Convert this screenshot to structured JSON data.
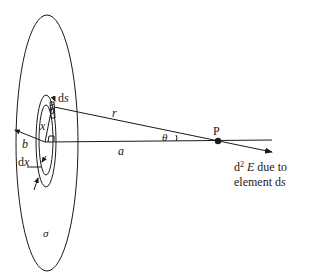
{
  "diagram": {
    "type": "physics-geometry",
    "labels": {
      "ds": "ds",
      "r": "r",
      "x": "x",
      "b": "b",
      "a": "a",
      "theta": "θ",
      "dx": "dx",
      "sigma": "σ",
      "P": "P",
      "field_line1": "d² E due to",
      "field_line1_d": "d",
      "field_line1_sup": "2",
      "field_line1_E": "E",
      "field_line1_rest": " due to",
      "field_line2_prefix": "element d",
      "field_line2_s": "s"
    },
    "elements": {
      "outer_disc": {
        "cx": 47,
        "cy": 143,
        "rx": 31,
        "ry": 128
      },
      "outer_ring": {
        "cx": 46,
        "cy": 141,
        "rx": 10,
        "ry": 46
      },
      "inner_ring": {
        "cx": 46,
        "cy": 140,
        "rx": 7,
        "ry": 35
      },
      "center": {
        "x": 45,
        "y": 142
      },
      "point_P": {
        "x": 218,
        "y": 141
      },
      "colors": {
        "ink": "#1a1a1a",
        "background": "#ffffff"
      }
    }
  }
}
